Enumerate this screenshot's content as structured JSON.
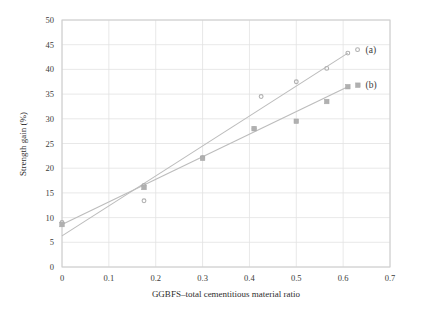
{
  "chart_data": {
    "type": "scatter",
    "title": "",
    "subtitle": "",
    "xlabel": "GGBFS–total cementitious material ratio",
    "ylabel": "Strength gain (%)",
    "xlim": [
      0,
      0.7
    ],
    "ylim": [
      0,
      50
    ],
    "grid": true,
    "legend_position": "right-inline",
    "x_ticks": [
      "0",
      "0.1",
      "0.2",
      "0.3",
      "0.4",
      "0.5",
      "0.6",
      "0.7"
    ],
    "x_tick_values": [
      0,
      0.1,
      0.2,
      0.3,
      0.4,
      0.5,
      0.6,
      0.7
    ],
    "y_ticks": [
      "0",
      "5",
      "10",
      "15",
      "20",
      "25",
      "30",
      "35",
      "40",
      "45",
      "50"
    ],
    "y_tick_values": [
      0,
      5,
      10,
      15,
      20,
      25,
      30,
      35,
      40,
      45,
      50
    ],
    "series": [
      {
        "name": "(a)",
        "marker": "circle",
        "color": "#b4b4b4",
        "points": [
          {
            "x": 0.0,
            "y": 9.0
          },
          {
            "x": 0.175,
            "y": 16.5
          },
          {
            "x": 0.175,
            "y": 13.4
          },
          {
            "x": 0.3,
            "y": 22.2
          },
          {
            "x": 0.41,
            "y": 28.0
          },
          {
            "x": 0.425,
            "y": 34.5
          },
          {
            "x": 0.5,
            "y": 37.5
          },
          {
            "x": 0.565,
            "y": 40.2
          },
          {
            "x": 0.61,
            "y": 43.3
          }
        ],
        "fit_line": {
          "x1": 0.0,
          "y1": 6.3,
          "x2": 0.61,
          "y2": 43.3
        },
        "label_x": 0.635,
        "label_y": 44.0
      },
      {
        "name": "(b)",
        "marker": "square",
        "color": "#b4b4b4",
        "points": [
          {
            "x": 0.0,
            "y": 8.6
          },
          {
            "x": 0.175,
            "y": 16.1
          },
          {
            "x": 0.3,
            "y": 22.0
          },
          {
            "x": 0.41,
            "y": 28.0
          },
          {
            "x": 0.5,
            "y": 29.5
          },
          {
            "x": 0.565,
            "y": 33.5
          },
          {
            "x": 0.61,
            "y": 36.5
          }
        ],
        "fit_line": {
          "x1": 0.0,
          "y1": 8.6,
          "x2": 0.61,
          "y2": 36.5
        },
        "label_x": 0.635,
        "label_y": 36.8
      }
    ],
    "colors": {
      "grid": "#e2e2e2",
      "frame": "#cccccc",
      "marker": "#b0b0b0",
      "line": "#bcbcbc",
      "text": "#333333",
      "background": "#ffffff"
    }
  }
}
